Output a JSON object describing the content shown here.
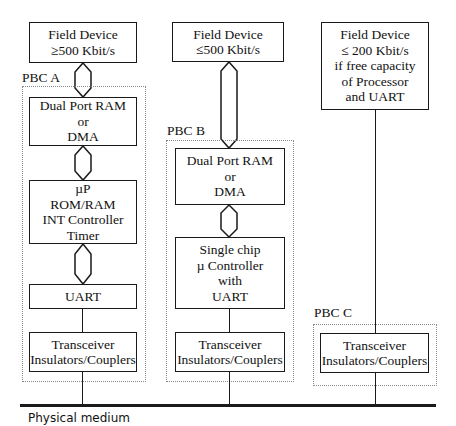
{
  "diagram": {
    "type": "block-diagram",
    "bus_label": "Physical medium",
    "columns": [
      {
        "id": "pbc_a",
        "group_label": "PBC A",
        "field_device": [
          "Field Device",
          "≥500 Kbit/s"
        ],
        "blocks": [
          [
            "Dual Port RAM",
            "or",
            "DMA"
          ],
          [
            "µP",
            "ROM/RAM",
            "INT Controller",
            "Timer"
          ],
          [
            "UART"
          ],
          [
            "Transceiver",
            "Insulators/Couplers"
          ]
        ],
        "connectors": [
          "bus",
          "bus",
          "bus",
          "line",
          "line"
        ]
      },
      {
        "id": "pbc_b",
        "group_label": "PBC B",
        "field_device": [
          "Field Device",
          "≤500 Kbit/s"
        ],
        "blocks": [
          [
            "Dual Port RAM",
            "or",
            "DMA"
          ],
          [
            "Single chip",
            "µ Controller",
            "with",
            "UART"
          ],
          [
            "Transceiver",
            "Insulators/Couplers"
          ]
        ],
        "connectors": [
          "bus",
          "bus",
          "line",
          "line"
        ]
      },
      {
        "id": "pbc_c",
        "group_label": "PBC C",
        "field_device": [
          "Field Device",
          "≤ 200 Kbit/s",
          "if free capacity",
          "of  Processor",
          "and UART"
        ],
        "blocks": [
          [
            "Transceiver",
            "Insulators/Couplers"
          ]
        ],
        "connectors": [
          "line",
          "line"
        ]
      }
    ]
  }
}
